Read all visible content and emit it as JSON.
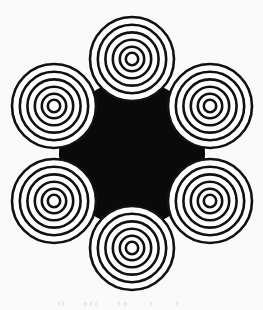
{
  "figure": {
    "title": "Hexagonal arrangement of concentric ring targets",
    "width": 263,
    "height": 310,
    "background_color": "#fbfafb",
    "ink_color": "#111111",
    "fill_color": "#ffffff",
    "negative_space_color": "#0a0a0a"
  },
  "palette": {
    "paper": "#fbfafb",
    "ink": "#111111",
    "disc_fill": "#ffffff",
    "core_black": "#0a0a0a"
  },
  "geometry": {
    "arrangement": "hexagonal",
    "disc_count": 6,
    "disc_outer_radius": 42,
    "ring_stroke_width": 2.6,
    "rings_per_disc": 6,
    "ring_radii": [
      42,
      34.2,
      26.6,
      19.2,
      12.2,
      6.2
    ],
    "hex_center": {
      "x": 132,
      "y": 153.5
    },
    "hex_ring_radius": 95,
    "black_core_radius": 47
  },
  "discs": [
    {
      "name": "top",
      "cx": 132,
      "cy": 59,
      "angle_deg": 270
    },
    {
      "name": "upper-right",
      "cx": 210,
      "cy": 106,
      "angle_deg": 330
    },
    {
      "name": "lower-right",
      "cx": 210,
      "cy": 201,
      "angle_deg": 30
    },
    {
      "name": "bottom",
      "cx": 132,
      "cy": 248,
      "angle_deg": 90
    },
    {
      "name": "lower-left",
      "cx": 54,
      "cy": 201,
      "angle_deg": 150
    },
    {
      "name": "upper-left",
      "cx": 54,
      "cy": 106,
      "angle_deg": 210
    }
  ],
  "artifacts": {
    "present": true,
    "description": "Faint residual scanning speckles along the lower margin, illegible.",
    "marks": [
      {
        "x": 58,
        "y": 4,
        "w": 2,
        "h": 4
      },
      {
        "x": 62,
        "y": 3,
        "w": 2,
        "h": 5
      },
      {
        "x": 84,
        "y": 4,
        "w": 3,
        "h": 4
      },
      {
        "x": 90,
        "y": 3,
        "w": 2,
        "h": 5
      },
      {
        "x": 95,
        "y": 4,
        "w": 2,
        "h": 4
      },
      {
        "x": 118,
        "y": 3,
        "w": 2,
        "h": 5
      },
      {
        "x": 124,
        "y": 4,
        "w": 3,
        "h": 4
      },
      {
        "x": 150,
        "y": 4,
        "w": 2,
        "h": 4
      },
      {
        "x": 176,
        "y": 3,
        "w": 2,
        "h": 5
      }
    ]
  }
}
